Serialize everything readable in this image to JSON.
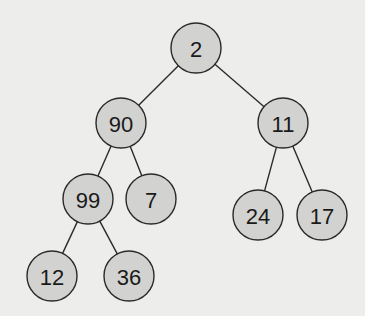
{
  "diagram": {
    "type": "binary-tree",
    "colors": {
      "background": "#ededeb",
      "node_fill": "#d2d2d0",
      "node_stroke": "#2a2a2a",
      "edge": "#2a2a2a",
      "text": "#1a1a1a"
    },
    "node_radius": 25,
    "nodes": [
      {
        "id": "n2",
        "label": "2",
        "x": 196,
        "y": 48
      },
      {
        "id": "n90",
        "label": "90",
        "x": 121,
        "y": 123
      },
      {
        "id": "n11",
        "label": "11",
        "x": 283,
        "y": 123
      },
      {
        "id": "n99",
        "label": "99",
        "x": 88,
        "y": 199
      },
      {
        "id": "n7",
        "label": "7",
        "x": 151,
        "y": 199
      },
      {
        "id": "n24",
        "label": "24",
        "x": 258,
        "y": 215
      },
      {
        "id": "n17",
        "label": "17",
        "x": 322,
        "y": 215
      },
      {
        "id": "n12",
        "label": "12",
        "x": 52,
        "y": 276
      },
      {
        "id": "n36",
        "label": "36",
        "x": 129,
        "y": 276
      }
    ],
    "edges": [
      {
        "from": "n2",
        "to": "n90"
      },
      {
        "from": "n2",
        "to": "n11"
      },
      {
        "from": "n90",
        "to": "n99"
      },
      {
        "from": "n90",
        "to": "n7"
      },
      {
        "from": "n11",
        "to": "n24"
      },
      {
        "from": "n11",
        "to": "n17"
      },
      {
        "from": "n99",
        "to": "n12"
      },
      {
        "from": "n99",
        "to": "n36"
      }
    ]
  }
}
